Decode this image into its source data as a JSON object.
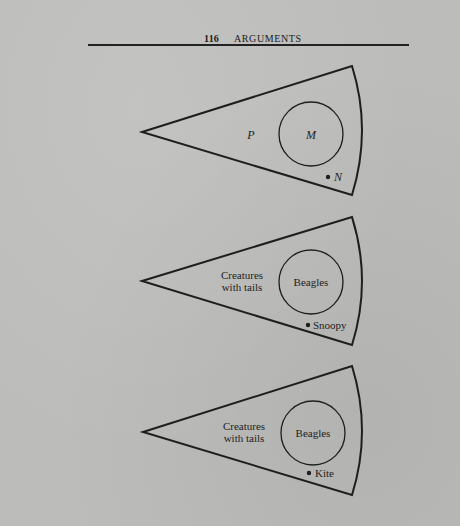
{
  "page": {
    "number": "116",
    "running_title": "ARGUMENTS"
  },
  "colors": {
    "paper": "#bcbcba",
    "ink": "#1e1e1e"
  },
  "diagrams": [
    {
      "outer_label_line1": "P",
      "outer_label_line2": "",
      "inner_label": "M",
      "point_label": "N",
      "labels_italic": true
    },
    {
      "outer_label_line1": "Creatures",
      "outer_label_line2": "with tails",
      "inner_label": "Beagles",
      "point_label": "Snoopy",
      "labels_italic": false
    },
    {
      "outer_label_line1": "Creatures",
      "outer_label_line2": "with tails",
      "inner_label": "Beagles",
      "point_label": "Kite",
      "labels_italic": false
    }
  ]
}
